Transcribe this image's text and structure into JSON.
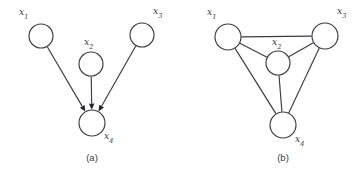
{
  "figure": {
    "background_color": "#ffffff",
    "stroke_color": "#3b3b42",
    "node_fill_color": "#ffffff",
    "arrow_color": "#24242a",
    "panels": [
      {
        "id": "panel-a",
        "caption": "(a)",
        "caption_x": 92,
        "caption_y": 161,
        "type": "directed-graph",
        "nodes": [
          {
            "id": "x1",
            "label_base": "x",
            "label_sub": "1",
            "cx": 41,
            "cy": 36,
            "r": 12,
            "label_x": 19,
            "label_y": 15
          },
          {
            "id": "x2",
            "label_base": "x",
            "label_sub": "2",
            "cx": 91,
            "cy": 64,
            "r": 12,
            "label_x": 84,
            "label_y": 45
          },
          {
            "id": "x3",
            "label_base": "x",
            "label_sub": "3",
            "cx": 142,
            "cy": 35,
            "r": 12,
            "label_x": 153,
            "label_y": 14
          },
          {
            "id": "x4",
            "label_base": "x",
            "label_sub": "4",
            "cx": 92,
            "cy": 123,
            "r": 13,
            "label_x": 104,
            "label_y": 139
          }
        ],
        "edges": [
          {
            "id": "x1-x4",
            "from": "x1",
            "to": "x4",
            "directed": true
          },
          {
            "id": "x2-x4",
            "from": "x2",
            "to": "x4",
            "directed": true
          },
          {
            "id": "x3-x4",
            "from": "x3",
            "to": "x4",
            "directed": true
          }
        ]
      },
      {
        "id": "panel-b",
        "caption": "(b)",
        "caption_x": 283,
        "caption_y": 161,
        "type": "undirected-graph",
        "nodes": [
          {
            "id": "x1",
            "label_base": "x",
            "label_sub": "1",
            "cx": 228,
            "cy": 37,
            "r": 13,
            "label_x": 207,
            "label_y": 15
          },
          {
            "id": "x2",
            "label_base": "x",
            "label_sub": "2",
            "cx": 278,
            "cy": 63,
            "r": 12,
            "label_x": 272,
            "label_y": 45
          },
          {
            "id": "x3",
            "label_base": "x",
            "label_sub": "3",
            "cx": 325,
            "cy": 36,
            "r": 13,
            "label_x": 337,
            "label_y": 14
          },
          {
            "id": "x4",
            "label_base": "x",
            "label_sub": "4",
            "cx": 283,
            "cy": 125,
            "r": 13,
            "label_x": 295,
            "label_y": 142
          }
        ],
        "edges": [
          {
            "id": "x1-x3",
            "from": "x1",
            "to": "x3",
            "directed": false
          },
          {
            "id": "x1-x2",
            "from": "x1",
            "to": "x2",
            "directed": false
          },
          {
            "id": "x2-x3",
            "from": "x2",
            "to": "x3",
            "directed": false
          },
          {
            "id": "x1-x4",
            "from": "x1",
            "to": "x4",
            "directed": false
          },
          {
            "id": "x2-x4",
            "from": "x2",
            "to": "x4",
            "directed": false
          },
          {
            "id": "x3-x4",
            "from": "x3",
            "to": "x4",
            "directed": false
          }
        ]
      }
    ]
  }
}
